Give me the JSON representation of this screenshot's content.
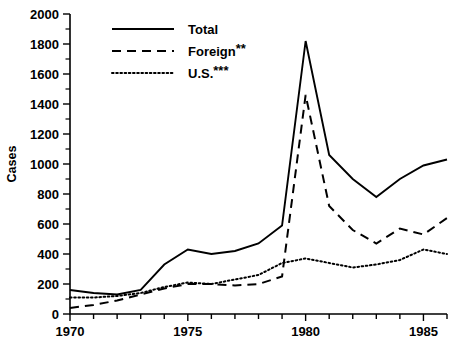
{
  "chart_data": {
    "type": "line",
    "title": "",
    "xlabel": "",
    "ylabel": "Cases",
    "xlim": [
      1970,
      1986
    ],
    "ylim": [
      0,
      2000
    ],
    "ytick_step": 200,
    "yminor_step": 100,
    "xtick_step": 1,
    "xlabel_step": 5,
    "grid": false,
    "legend_position": "top-left",
    "x": [
      1970,
      1971,
      1972,
      1973,
      1974,
      1975,
      1976,
      1977,
      1978,
      1979,
      1980,
      1981,
      1982,
      1983,
      1984,
      1985,
      1986
    ],
    "xticklabels": [
      "1970",
      "",
      "",
      "",
      "",
      "1975",
      "",
      "",
      "",
      "",
      "1980",
      "",
      "",
      "",
      "",
      "1985",
      ""
    ],
    "yticklabels": [
      "0",
      "200",
      "400",
      "600",
      "800",
      "1000",
      "1200",
      "1400",
      "1600",
      "1800",
      "2000"
    ],
    "series": [
      {
        "name": "Total",
        "style": "solid",
        "values": [
          160,
          140,
          130,
          160,
          330,
          430,
          400,
          420,
          470,
          590,
          1820,
          1060,
          900,
          780,
          900,
          990,
          1030
        ]
      },
      {
        "name": "Foreign**",
        "style": "dashed",
        "values": [
          40,
          60,
          90,
          130,
          170,
          200,
          200,
          190,
          200,
          250,
          1460,
          720,
          560,
          470,
          570,
          530,
          640
        ]
      },
      {
        "name": "U.S.***",
        "style": "dotted",
        "values": [
          110,
          110,
          120,
          140,
          180,
          210,
          200,
          230,
          260,
          340,
          370,
          340,
          310,
          330,
          360,
          430,
          400
        ]
      }
    ],
    "legend": [
      {
        "label": "Total",
        "sup": "",
        "style": "solid"
      },
      {
        "label": "Foreign",
        "sup": "**",
        "style": "dashed"
      },
      {
        "label": "U.S.",
        "sup": "***",
        "style": "dotted"
      }
    ],
    "annotations": {
      "footnote": ""
    }
  }
}
